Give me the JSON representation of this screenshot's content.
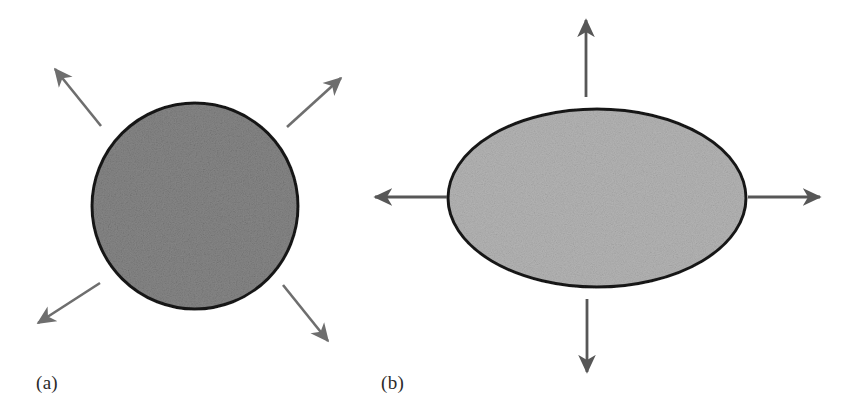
{
  "figure": {
    "background_color": "#ffffff",
    "panels": [
      {
        "id": "panel-a",
        "label": "(a)",
        "label_position": {
          "x": 36,
          "y": 372
        },
        "shape": {
          "type": "circle",
          "name": "isotropic-grain-circle",
          "center": {
            "x": 195,
            "y": 206
          },
          "radius": 103,
          "fill_color": "#878787",
          "stroke_color": "#1a1a1a",
          "stroke_width": 3
        },
        "arrows": [
          {
            "name": "arrow-up-left",
            "direction": "up-left",
            "x1": 101,
            "y1": 126,
            "x2": 55,
            "y2": 69,
            "color": "#6e6e6e"
          },
          {
            "name": "arrow-up-right",
            "direction": "up-right",
            "x1": 287,
            "y1": 127,
            "x2": 341,
            "y2": 78,
            "color": "#6e6e6e"
          },
          {
            "name": "arrow-down-left",
            "direction": "down-left",
            "x1": 100,
            "y1": 283,
            "x2": 38,
            "y2": 323,
            "color": "#6e6e6e"
          },
          {
            "name": "arrow-down-right",
            "direction": "down-right",
            "x1": 283,
            "y1": 285,
            "x2": 328,
            "y2": 341,
            "color": "#6e6e6e"
          }
        ]
      },
      {
        "id": "panel-b",
        "label": "(b)",
        "label_position": {
          "x": 381,
          "y": 372
        },
        "shape": {
          "type": "ellipse",
          "name": "anisotropic-grain-ellipse",
          "center": {
            "x": 597,
            "y": 198
          },
          "radius_x": 149,
          "radius_y": 89,
          "fill_color": "#b4b4b4",
          "stroke_color": "#1a1a1a",
          "stroke_width": 3
        },
        "arrows": [
          {
            "name": "arrow-up",
            "direction": "up",
            "x1": 586,
            "y1": 97,
            "x2": 586,
            "y2": 20,
            "color": "#575757"
          },
          {
            "name": "arrow-down",
            "direction": "down",
            "x1": 587,
            "y1": 299,
            "x2": 587,
            "y2": 372,
            "color": "#575757"
          },
          {
            "name": "arrow-left",
            "direction": "left",
            "x1": 447,
            "y1": 197,
            "x2": 375,
            "y2": 197,
            "color": "#575757"
          },
          {
            "name": "arrow-right",
            "direction": "right",
            "x1": 748,
            "y1": 197,
            "x2": 820,
            "y2": 197,
            "color": "#575757"
          }
        ]
      }
    ]
  }
}
